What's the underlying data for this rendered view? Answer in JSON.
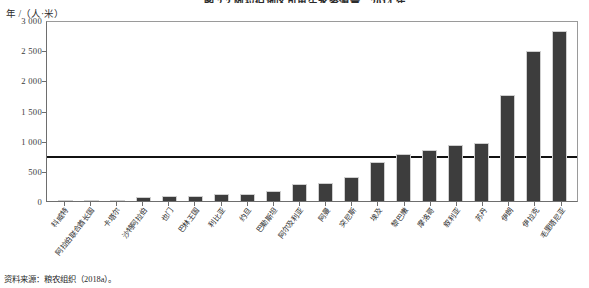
{
  "figure": {
    "title": "图 2.3    阿拉伯地区可再生水资源量，2014 年",
    "y_axis_caption": "年 /（人·米）",
    "source_note": "资料来源：粮农组织（2018a）。"
  },
  "chart_data": {
    "type": "bar",
    "title": "图 2.3    阿拉伯地区可再生水资源量，2014 年",
    "xlabel": "",
    "ylabel": "年 /（人·米）",
    "ylim": [
      0,
      3000
    ],
    "yticks": [
      "0",
      "500",
      "1 000",
      "1 500",
      "2 000",
      "2 500",
      "3 000"
    ],
    "ytick_values": [
      0,
      500,
      1000,
      1500,
      2000,
      2500,
      3000
    ],
    "grid": false,
    "legend": "none",
    "bar_color": "#3d3d3d",
    "reference_line": {
      "label": "",
      "value": 713,
      "color": "#111111"
    },
    "categories": [
      "科威特",
      "阿拉伯联合酋长国",
      "卡塔尔",
      "沙特阿拉伯",
      "也门",
      "巴林王国",
      "利比亚",
      "约旦",
      "巴勒斯坦",
      "阿尔及利亚",
      "阿曼",
      "突尼斯",
      "埃及",
      "黎巴嫩",
      "摩洛哥",
      "叙利亚",
      "苏丹",
      "伊朗",
      "伊拉克",
      "毛里塔尼亚"
    ],
    "values": [
      6,
      16,
      24,
      74,
      78,
      88,
      108,
      120,
      170,
      285,
      300,
      390,
      650,
      780,
      845,
      930,
      960,
      1760,
      2480,
      2810
    ]
  }
}
